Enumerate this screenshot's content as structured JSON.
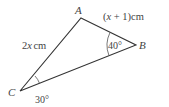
{
  "diagram": {
    "type": "triangle",
    "vertices": {
      "A": {
        "label": "A",
        "x": 81,
        "y": 18
      },
      "B": {
        "label": "B",
        "x": 136,
        "y": 45
      },
      "C": {
        "label": "C",
        "x": 20,
        "y": 91
      }
    },
    "sides": {
      "AB": {
        "label_pre": "(",
        "label_var": "x",
        "label_post": " + 1)cm"
      },
      "AC": {
        "label_num": "2",
        "label_var": "x",
        "label_unit": "cm"
      }
    },
    "angles": {
      "B": {
        "value": "40°"
      },
      "C": {
        "value": "30°"
      }
    },
    "line_color": "#333333",
    "text_color": "#444444"
  }
}
